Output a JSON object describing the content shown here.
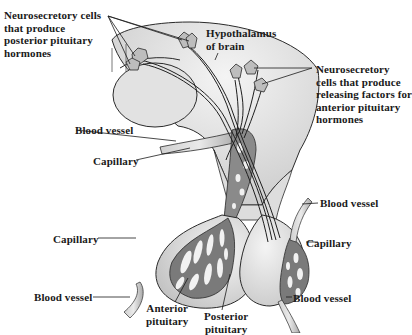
{
  "diagram": {
    "colors": {
      "background": "#ffffff",
      "tissue_fill": "#d9d9d9",
      "tissue_light": "#eeeeee",
      "capillary_fill": "#7a7a7a",
      "outline": "#2a2a2a",
      "text": "#1a1a1a"
    },
    "labels": {
      "neurosecretory_posterior": "Neurosecretory cells\nthat produce\nposterior pituitary\nhormones",
      "hypothalamus": "Hypothalamus\nof brain",
      "neurosecretory_anterior": "Neurosecretory\ncells that produce\nreleasing factors for\nanterior pituitary\nhormones",
      "blood_vessel_upper_left": "Blood vessel",
      "capillary_upper_left": "Capillary",
      "blood_vessel_upper_right": "Blood vessel",
      "capillary_left": "Capillary",
      "capillary_right": "Capillary",
      "blood_vessel_lower_left": "Blood vessel",
      "blood_vessel_lower_right": "Blood vessel",
      "anterior_pituitary": "Anterior\npituitary",
      "posterior_pituitary": "Posterior\npituitary"
    }
  }
}
